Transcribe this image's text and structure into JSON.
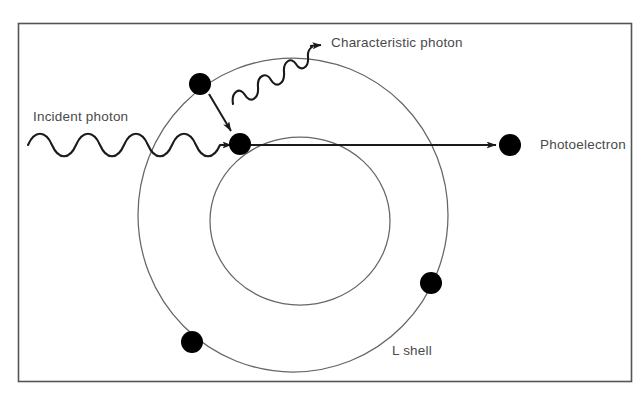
{
  "figure": {
    "background_color": "#ffffff",
    "border_color": "#555555",
    "frame": {
      "x": 18,
      "y": 23,
      "width": 614,
      "height": 359
    }
  },
  "labels": {
    "incident_photon": "Incident photon",
    "characteristic_photon": "Characteristic photon",
    "photoelectron": "Photoelectron",
    "l_shell": "L shell"
  },
  "colors": {
    "stroke": "#444444",
    "shell_stroke": "#666666",
    "electron_fill": "#000000",
    "text": "#4a4a4a"
  },
  "shells": [
    {
      "name": "L shell",
      "type": "outer",
      "cx": 293,
      "cy": 215,
      "rx": 155,
      "ry": 157
    },
    {
      "name": "K shell",
      "type": "inner",
      "cx": 300,
      "cy": 221,
      "rx": 90,
      "ry": 84
    }
  ],
  "electrons": [
    {
      "name": "l-shell-electron-transitioning",
      "cx": 200,
      "cy": 84,
      "r": 11
    },
    {
      "name": "k-shell-vacancy-electron",
      "cx": 240,
      "cy": 144,
      "r": 11
    },
    {
      "name": "l-shell-electron-lower-left",
      "cx": 192,
      "cy": 342,
      "r": 11
    },
    {
      "name": "l-shell-electron-right",
      "cx": 431,
      "cy": 283,
      "r": 11
    },
    {
      "name": "ejected-photoelectron",
      "cx": 510,
      "cy": 145,
      "r": 11
    }
  ],
  "waves": {
    "incident_photon": {
      "start_x": 28,
      "end_x": 228,
      "baseline_y": 145,
      "amplitude": 9,
      "cycles": 6,
      "arrow_tip_x": 232,
      "arrow_tip_y": 145
    },
    "characteristic_photon": {
      "start_x": 232,
      "start_y": 102,
      "end_x": 312,
      "end_y": 48,
      "amplitude": 8,
      "cycles": 5,
      "arrow_tip_x": 323,
      "arrow_tip_y": 44
    }
  },
  "arrows": {
    "electron_transition": {
      "from_x": 210,
      "from_y": 95,
      "to_x": 232,
      "to_y": 132
    },
    "photoelectron_ejection": {
      "from_x": 250,
      "from_y": 145,
      "to_x": 497,
      "to_y": 145
    }
  }
}
